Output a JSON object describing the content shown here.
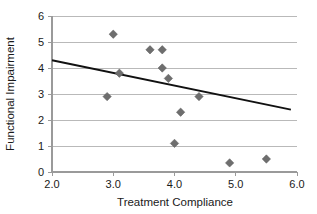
{
  "chart_data": {
    "type": "scatter",
    "title": "",
    "xlabel": "Treatment Compliance",
    "ylabel": "Functional Impairment",
    "xlim": [
      2.0,
      6.0
    ],
    "ylim": [
      0,
      6
    ],
    "xticks": [
      2.0,
      3.0,
      4.0,
      5.0,
      6.0
    ],
    "xtick_labels": [
      "2.0",
      "3.0",
      "4.0",
      "5.0",
      "6.0"
    ],
    "yticks": [
      0,
      1,
      2,
      3,
      4,
      5,
      6
    ],
    "ytick_labels": [
      "0",
      "1",
      "2",
      "3",
      "4",
      "5",
      "6"
    ],
    "grid": "horizontal",
    "legend": "none",
    "marker_symbol": "diamond",
    "marker_color": "#6e6e6e",
    "points": [
      {
        "x": 2.9,
        "y": 2.9
      },
      {
        "x": 3.0,
        "y": 5.3
      },
      {
        "x": 3.1,
        "y": 3.8
      },
      {
        "x": 3.6,
        "y": 4.7
      },
      {
        "x": 3.8,
        "y": 4.7
      },
      {
        "x": 3.8,
        "y": 4.0
      },
      {
        "x": 3.9,
        "y": 3.6
      },
      {
        "x": 4.0,
        "y": 1.1
      },
      {
        "x": 4.1,
        "y": 2.3
      },
      {
        "x": 4.4,
        "y": 2.9
      },
      {
        "x": 4.9,
        "y": 0.35
      },
      {
        "x": 5.5,
        "y": 0.5
      }
    ],
    "trend_line": {
      "type": "linear-fit",
      "color": "#111111",
      "x_start": 2.0,
      "y_start": 4.3,
      "x_end": 5.9,
      "y_end": 2.4
    }
  }
}
